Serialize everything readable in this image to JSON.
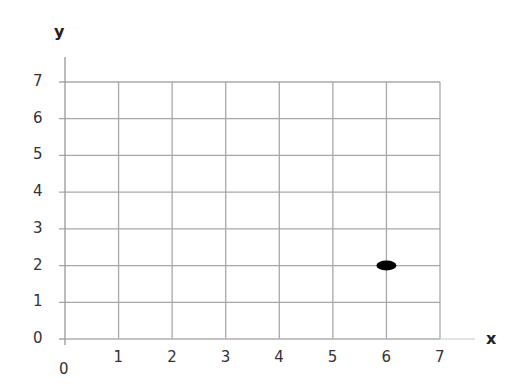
{
  "chart_data": {
    "type": "scatter",
    "title": "",
    "xlabel": "x",
    "ylabel": "y",
    "xlim": [
      0,
      7
    ],
    "ylim": [
      0,
      7
    ],
    "grid": true,
    "x_ticks": [
      "1",
      "2",
      "3",
      "4",
      "5",
      "6",
      "7"
    ],
    "y_ticks": [
      "0",
      "1",
      "2",
      "3",
      "4",
      "5",
      "6",
      "7"
    ],
    "origin_label": "0",
    "series": [
      {
        "name": "point",
        "x": [
          6
        ],
        "y": [
          2
        ]
      }
    ]
  },
  "colors": {
    "grid": "#a8a8a8",
    "axis": "#999999",
    "point": "#000000",
    "text": "#333333"
  }
}
